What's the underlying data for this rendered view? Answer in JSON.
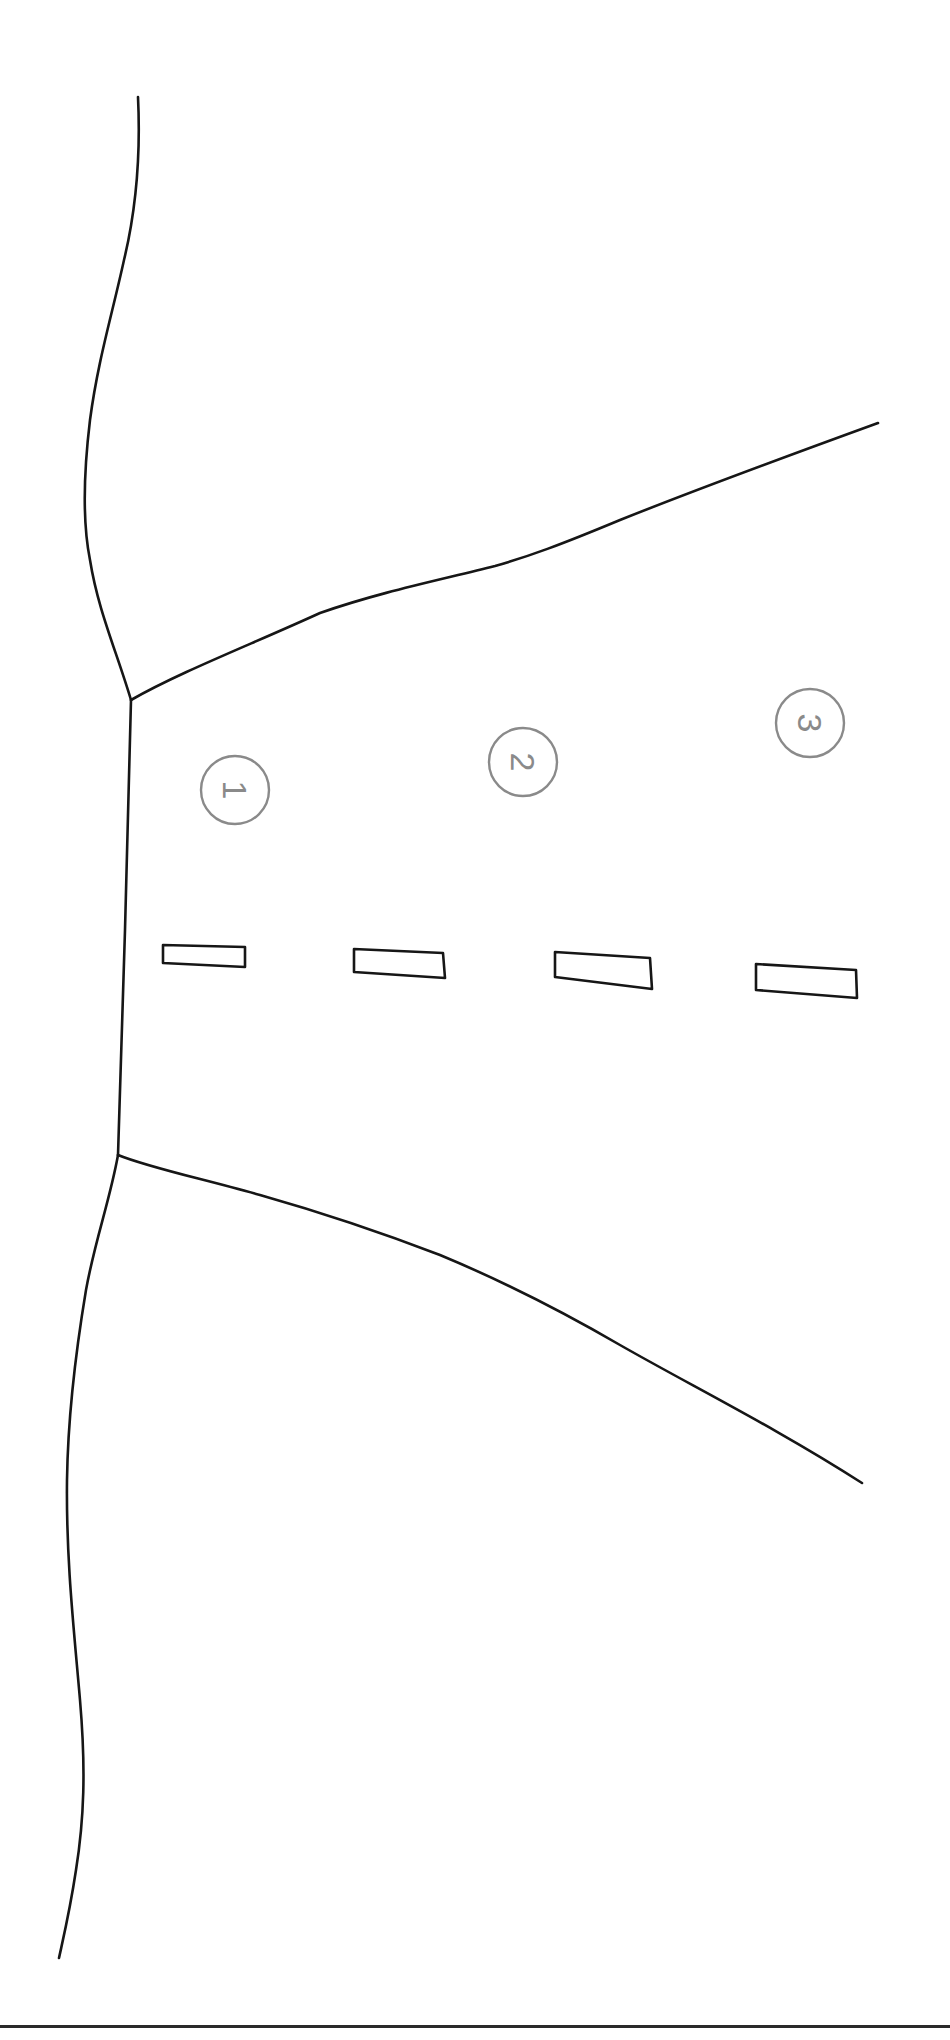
{
  "diagram": {
    "markers": [
      {
        "label": "1",
        "cx": 235,
        "cy": 790,
        "r": 34
      },
      {
        "label": "2",
        "cx": 523,
        "cy": 762,
        "r": 34
      },
      {
        "label": "3",
        "cx": 810,
        "cy": 723,
        "r": 34
      }
    ],
    "lane_dashes": [
      {
        "points": "163,945 245,947 245,967 163,963"
      },
      {
        "points": "354,949 443,953 445,978 354,972"
      },
      {
        "points": "555,952 650,958 652,989 555,977"
      },
      {
        "points": "756,964 856,970 857,998 756,990"
      }
    ],
    "colors": {
      "line": "#161616",
      "marker": "#8a8a8a",
      "background": "#ffffff",
      "rule": "#2a2a2a"
    }
  }
}
